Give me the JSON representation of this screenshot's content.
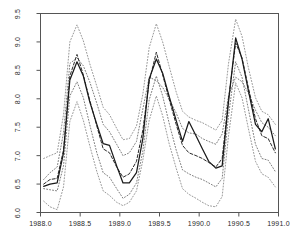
{
  "chart_data": {
    "type": "line",
    "title": "",
    "subtitle": "",
    "xlabel": "",
    "ylabel": "",
    "xlim": [
      1988.0,
      1991.0
    ],
    "ylim": [
      6.0,
      9.5
    ],
    "xticks": [
      1988.0,
      1988.5,
      1989.0,
      1989.5,
      1990.0,
      1990.5,
      1991.0
    ],
    "xticklabels": [
      "1988.0",
      "1988.5",
      "1989.0",
      "1989.5",
      "1990.0",
      "1990.5",
      "1991.0"
    ],
    "yticks": [
      6.0,
      6.5,
      7.0,
      7.5,
      8.0,
      8.5,
      9.0,
      9.5
    ],
    "yticklabels": [
      "6.0",
      "6.5",
      "7.0",
      "7.5",
      "8.0",
      "8.5",
      "9.0",
      "9.5"
    ],
    "grid": false,
    "legend": "none",
    "box": "full",
    "colors": {
      "observed": "#1a1a1a",
      "fitted": "#2b2b2b",
      "inner_band": "#6e6e6e",
      "outer_band": "#8c8c8c",
      "axis": "#555555",
      "background": "#ffffff"
    },
    "x": [
      1988.04,
      1988.12,
      1988.21,
      1988.29,
      1988.37,
      1988.46,
      1988.54,
      1988.62,
      1988.71,
      1988.79,
      1988.87,
      1988.96,
      1989.04,
      1989.12,
      1989.21,
      1989.29,
      1989.37,
      1989.46,
      1989.54,
      1989.62,
      1989.71,
      1989.79,
      1989.87,
      1989.96,
      1990.04,
      1990.12,
      1990.21,
      1990.29,
      1990.37,
      1990.46,
      1990.54,
      1990.62,
      1990.71,
      1990.79,
      1990.87,
      1990.96
    ],
    "series": [
      {
        "name": "observed",
        "style": "solid",
        "values": [
          6.46,
          6.5,
          6.52,
          7.05,
          8.33,
          8.65,
          8.4,
          7.95,
          7.55,
          7.21,
          7.18,
          6.82,
          6.52,
          6.52,
          6.7,
          7.3,
          8.35,
          8.7,
          8.45,
          8.05,
          7.62,
          7.25,
          7.6,
          7.35,
          7.12,
          6.9,
          6.78,
          6.82,
          7.95,
          9.07,
          8.7,
          8.15,
          7.55,
          7.42,
          7.65,
          7.12
        ]
      },
      {
        "name": "fitted",
        "style": "dashed",
        "values": [
          6.5,
          6.58,
          6.6,
          7.1,
          8.4,
          8.78,
          8.42,
          7.98,
          7.52,
          7.12,
          7.05,
          6.8,
          6.62,
          6.68,
          6.9,
          7.45,
          8.3,
          8.82,
          8.42,
          8.0,
          7.55,
          7.18,
          7.05,
          7.0,
          6.95,
          6.88,
          6.8,
          6.95,
          8.0,
          8.98,
          8.72,
          8.2,
          7.65,
          7.35,
          7.3,
          7.05
        ]
      },
      {
        "name": "inner_band_upper",
        "style": "dotted",
        "values": [
          6.58,
          6.7,
          6.8,
          7.4,
          8.62,
          8.72,
          8.58,
          8.3,
          7.92,
          7.55,
          7.42,
          7.2,
          7.0,
          7.05,
          7.25,
          7.82,
          8.38,
          8.32,
          8.2,
          8.0,
          7.75,
          7.48,
          7.4,
          7.38,
          7.3,
          7.25,
          7.2,
          7.38,
          8.05,
          8.38,
          8.3,
          8.1,
          7.8,
          7.58,
          7.5,
          7.35
        ]
      },
      {
        "name": "inner_band_lower",
        "style": "dotted",
        "values": [
          6.42,
          6.4,
          6.38,
          6.82,
          8.05,
          8.3,
          8.02,
          7.55,
          7.05,
          6.7,
          6.62,
          6.42,
          6.25,
          6.32,
          6.52,
          7.08,
          7.98,
          8.4,
          8.05,
          7.58,
          7.1,
          6.75,
          6.68,
          6.62,
          6.58,
          6.52,
          6.45,
          6.6,
          7.7,
          8.65,
          8.38,
          7.82,
          7.2,
          6.95,
          6.92,
          6.72
        ]
      },
      {
        "name": "outer_band_upper",
        "style": "dotted",
        "values": [
          6.95,
          7.0,
          7.05,
          7.72,
          9.0,
          9.3,
          9.02,
          8.62,
          8.22,
          7.85,
          7.72,
          7.48,
          7.28,
          7.3,
          7.52,
          8.08,
          8.9,
          9.32,
          9.0,
          8.58,
          8.12,
          7.78,
          7.68,
          7.62,
          7.58,
          7.52,
          7.45,
          7.62,
          8.62,
          9.4,
          9.1,
          8.55,
          8.02,
          7.78,
          7.72,
          7.55
        ]
      },
      {
        "name": "outer_band_lower",
        "style": "dotted",
        "values": [
          6.2,
          6.1,
          6.05,
          6.45,
          7.6,
          7.95,
          7.62,
          7.18,
          6.72,
          6.38,
          6.3,
          6.18,
          6.12,
          6.18,
          6.38,
          6.92,
          7.62,
          8.05,
          7.7,
          7.22,
          6.78,
          6.42,
          6.32,
          6.25,
          6.18,
          6.12,
          6.1,
          6.28,
          7.35,
          8.28,
          8.02,
          7.48,
          6.9,
          6.68,
          6.62,
          6.45
        ]
      }
    ]
  }
}
